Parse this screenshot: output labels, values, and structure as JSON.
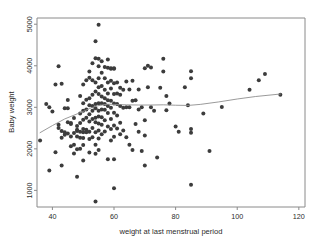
{
  "chart_data": {
    "type": "scatter",
    "title": "",
    "xlabel": "weight at last menstrual period",
    "ylabel": "Baby weight",
    "xlim": [
      35,
      122
    ],
    "ylim": [
      600,
      5150
    ],
    "xticks": [
      40,
      60,
      80,
      100,
      120
    ],
    "yticks": [
      1000,
      2000,
      3000,
      4000,
      5000
    ],
    "xtick_labels": [
      "40",
      "60",
      "80",
      "100",
      "120"
    ],
    "ytick_labels": [
      "1000",
      "2000",
      "3000",
      "4000",
      "5000"
    ],
    "grid": false,
    "legend": "none",
    "marker": {
      "shape": "circle",
      "color": "#3c3c3c",
      "size": 3
    },
    "series": [
      {
        "name": "observations",
        "type": "scatter",
        "n": 189,
        "points": [
          [
            36,
            2200
          ],
          [
            38,
            3080
          ],
          [
            39,
            3000
          ],
          [
            39,
            1480
          ],
          [
            40,
            2900
          ],
          [
            41,
            3550
          ],
          [
            41,
            1920
          ],
          [
            42,
            3990
          ],
          [
            42,
            2580
          ],
          [
            42,
            2500
          ],
          [
            43,
            3570
          ],
          [
            43,
            2430
          ],
          [
            43,
            2270
          ],
          [
            43,
            1600
          ],
          [
            44,
            2400
          ],
          [
            44,
            2340
          ],
          [
            44,
            2980
          ],
          [
            45,
            2980
          ],
          [
            45,
            2640
          ],
          [
            45,
            2370
          ],
          [
            45,
            3175
          ],
          [
            46,
            2620
          ],
          [
            46,
            2600
          ],
          [
            46,
            2300
          ],
          [
            46,
            2065
          ],
          [
            47,
            2740
          ],
          [
            47,
            2380
          ],
          [
            47,
            2100
          ],
          [
            47,
            1890
          ],
          [
            48,
            2550
          ],
          [
            48,
            2460
          ],
          [
            48,
            2430
          ],
          [
            48,
            2300
          ],
          [
            48,
            1990
          ],
          [
            48,
            1330
          ],
          [
            49,
            3270
          ],
          [
            49,
            2850
          ],
          [
            49,
            2620
          ],
          [
            49,
            2410
          ],
          [
            49,
            2270
          ],
          [
            49,
            2000
          ],
          [
            50,
            3550
          ],
          [
            50,
            3100
          ],
          [
            50,
            2920
          ],
          [
            50,
            2700
          ],
          [
            50,
            2480
          ],
          [
            50,
            2400
          ],
          [
            50,
            2260
          ],
          [
            50,
            2090
          ],
          [
            50,
            1720
          ],
          [
            51,
            3650
          ],
          [
            51,
            3180
          ],
          [
            51,
            2950
          ],
          [
            51,
            2750
          ],
          [
            51,
            2460
          ],
          [
            51,
            2400
          ],
          [
            52,
            3860
          ],
          [
            52,
            3710
          ],
          [
            52,
            3220
          ],
          [
            52,
            3050
          ],
          [
            52,
            2835
          ],
          [
            52,
            2660
          ],
          [
            52,
            2410
          ],
          [
            52,
            2240
          ],
          [
            52,
            1910
          ],
          [
            53,
            4060
          ],
          [
            53,
            3650
          ],
          [
            53,
            3300
          ],
          [
            53,
            3030
          ],
          [
            53,
            2920
          ],
          [
            53,
            2720
          ],
          [
            53,
            2500
          ],
          [
            53,
            2280
          ],
          [
            54,
            4593
          ],
          [
            54,
            4180
          ],
          [
            54,
            3600
          ],
          [
            54,
            3380
          ],
          [
            54,
            3080
          ],
          [
            54,
            2980
          ],
          [
            54,
            2750
          ],
          [
            54,
            2640
          ],
          [
            54,
            2400
          ],
          [
            54,
            2100
          ],
          [
            54,
            1880
          ],
          [
            54,
            730
          ],
          [
            55,
            4990
          ],
          [
            55,
            4170
          ],
          [
            55,
            3990
          ],
          [
            55,
            3700
          ],
          [
            55,
            3480
          ],
          [
            55,
            3320
          ],
          [
            55,
            3100
          ],
          [
            55,
            2920
          ],
          [
            55,
            2780
          ],
          [
            55,
            2610
          ],
          [
            55,
            2440
          ],
          [
            55,
            2250
          ],
          [
            55,
            1970
          ],
          [
            56,
            4110
          ],
          [
            56,
            3830
          ],
          [
            56,
            3510
          ],
          [
            56,
            3260
          ],
          [
            56,
            3100
          ],
          [
            56,
            2950
          ],
          [
            56,
            2760
          ],
          [
            56,
            2580
          ],
          [
            56,
            2350
          ],
          [
            57,
            3970
          ],
          [
            57,
            3700
          ],
          [
            57,
            3420
          ],
          [
            57,
            3220
          ],
          [
            57,
            3080
          ],
          [
            57,
            2940
          ],
          [
            57,
            2690
          ],
          [
            57,
            2420
          ],
          [
            58,
            4150
          ],
          [
            58,
            3950
          ],
          [
            58,
            3600
          ],
          [
            58,
            3330
          ],
          [
            58,
            3170
          ],
          [
            58,
            3030
          ],
          [
            58,
            2860
          ],
          [
            58,
            2540
          ],
          [
            58,
            1750
          ],
          [
            59,
            3930
          ],
          [
            59,
            3940
          ],
          [
            59,
            3640
          ],
          [
            59,
            3450
          ],
          [
            59,
            3160
          ],
          [
            59,
            2990
          ],
          [
            59,
            2720
          ],
          [
            59,
            2480
          ],
          [
            59,
            2200
          ],
          [
            60,
            3940
          ],
          [
            60,
            3930
          ],
          [
            60,
            3580
          ],
          [
            60,
            3320
          ],
          [
            60,
            3090
          ],
          [
            60,
            2870
          ],
          [
            60,
            2560
          ],
          [
            60,
            2290
          ],
          [
            60,
            1750
          ],
          [
            60,
            1050
          ],
          [
            61,
            3600
          ],
          [
            61,
            3330
          ],
          [
            61,
            3080
          ],
          [
            61,
            2800
          ],
          [
            61,
            2490
          ],
          [
            62,
            3470
          ],
          [
            62,
            3300
          ],
          [
            62,
            3030
          ],
          [
            62,
            2630
          ],
          [
            62,
            2350
          ],
          [
            63,
            3420
          ],
          [
            63,
            2990
          ],
          [
            63,
            2440
          ],
          [
            64,
            3620
          ],
          [
            64,
            3000
          ],
          [
            64,
            2280
          ],
          [
            65,
            3430
          ],
          [
            65,
            3000
          ],
          [
            65,
            2100
          ],
          [
            66,
            3640
          ],
          [
            66,
            3160
          ],
          [
            66,
            1970
          ],
          [
            67,
            3170
          ],
          [
            67,
            2600
          ],
          [
            68,
            3430
          ],
          [
            68,
            2950
          ],
          [
            68,
            2410
          ],
          [
            69,
            3000
          ],
          [
            69,
            1950
          ],
          [
            70,
            3940
          ],
          [
            70,
            2690
          ],
          [
            70,
            2320
          ],
          [
            70,
            1600
          ],
          [
            71,
            4000
          ],
          [
            71,
            3480
          ],
          [
            72,
            3960
          ],
          [
            72,
            3000
          ],
          [
            73,
            2920
          ],
          [
            74,
            1790
          ],
          [
            75,
            3470
          ],
          [
            76,
            4170
          ],
          [
            76,
            3860
          ],
          [
            77,
            3270
          ],
          [
            77,
            2930
          ],
          [
            78,
            3090
          ],
          [
            80,
            2540
          ],
          [
            81,
            2410
          ],
          [
            83,
            3480
          ],
          [
            84,
            3050
          ],
          [
            85,
            3870
          ],
          [
            85,
            3700
          ],
          [
            85,
            2390
          ],
          [
            85,
            2480
          ],
          [
            85,
            1135
          ],
          [
            89,
            2850
          ],
          [
            91,
            1950
          ],
          [
            95,
            3005
          ],
          [
            104,
            3420
          ],
          [
            107,
            3650
          ],
          [
            109,
            3800
          ],
          [
            114,
            3305
          ]
        ]
      },
      {
        "name": "lowess",
        "type": "line",
        "color": "#8f8f8f",
        "points": [
          [
            36,
            2390
          ],
          [
            40,
            2560
          ],
          [
            44,
            2720
          ],
          [
            48,
            2840
          ],
          [
            50,
            2900
          ],
          [
            52,
            2970
          ],
          [
            54,
            3025
          ],
          [
            56,
            3055
          ],
          [
            58,
            3075
          ],
          [
            60,
            3070
          ],
          [
            64,
            3060
          ],
          [
            68,
            3055
          ],
          [
            72,
            3055
          ],
          [
            76,
            3060
          ],
          [
            80,
            3050
          ],
          [
            84,
            3045
          ],
          [
            88,
            3070
          ],
          [
            94,
            3130
          ],
          [
            100,
            3200
          ],
          [
            106,
            3260
          ],
          [
            114,
            3320
          ]
        ]
      }
    ]
  },
  "axes": {
    "x_axis_name": "x-axis",
    "y_axis_name": "y-axis"
  }
}
